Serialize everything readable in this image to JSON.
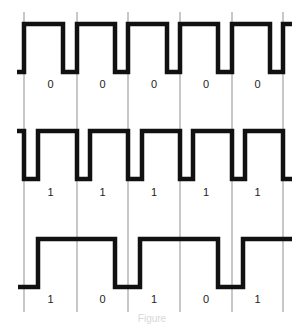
{
  "diagram": {
    "colors": {
      "background": "#ffffff",
      "waveform": "#111111",
      "gridline": "#c8c8c8",
      "label": "#222222"
    },
    "gridlines_x": [
      24,
      77,
      128,
      180,
      232,
      283
    ],
    "rows": [
      {
        "name": "all-zeros",
        "bits": [
          "0",
          "0",
          "0",
          "0",
          "0"
        ],
        "high_y": 24,
        "low_y": 72,
        "label_y": 88,
        "waveform_points": [
          [
            17,
            72
          ],
          [
            24,
            72
          ],
          [
            24,
            24
          ],
          [
            63,
            24
          ],
          [
            63,
            72
          ],
          [
            77,
            72
          ],
          [
            77,
            24
          ],
          [
            115,
            24
          ],
          [
            115,
            72
          ],
          [
            128,
            72
          ],
          [
            128,
            24
          ],
          [
            167,
            24
          ],
          [
            167,
            72
          ],
          [
            180,
            72
          ],
          [
            180,
            24
          ],
          [
            218,
            24
          ],
          [
            218,
            72
          ],
          [
            232,
            72
          ],
          [
            232,
            24
          ],
          [
            270,
            24
          ],
          [
            270,
            72
          ],
          [
            283,
            72
          ],
          [
            283,
            24
          ],
          [
            292,
            24
          ]
        ]
      },
      {
        "name": "all-ones",
        "bits": [
          "1",
          "1",
          "1",
          "1",
          "1"
        ],
        "high_y": 131,
        "low_y": 179,
        "label_y": 196,
        "waveform_points": [
          [
            17,
            131
          ],
          [
            24,
            131
          ],
          [
            24,
            179
          ],
          [
            38,
            179
          ],
          [
            38,
            131
          ],
          [
            77,
            131
          ],
          [
            77,
            179
          ],
          [
            90,
            179
          ],
          [
            90,
            131
          ],
          [
            128,
            131
          ],
          [
            128,
            179
          ],
          [
            142,
            179
          ],
          [
            142,
            131
          ],
          [
            180,
            131
          ],
          [
            180,
            179
          ],
          [
            193,
            179
          ],
          [
            193,
            131
          ],
          [
            232,
            131
          ],
          [
            232,
            179
          ],
          [
            245,
            179
          ],
          [
            245,
            131
          ],
          [
            283,
            131
          ],
          [
            283,
            179
          ],
          [
            292,
            179
          ]
        ]
      },
      {
        "name": "alternating",
        "bits": [
          "1",
          "0",
          "1",
          "0",
          "1"
        ],
        "high_y": 239,
        "low_y": 287,
        "label_y": 303,
        "waveform_points": [
          [
            18,
            287
          ],
          [
            38,
            287
          ],
          [
            38,
            239
          ],
          [
            115,
            239
          ],
          [
            115,
            287
          ],
          [
            140,
            287
          ],
          [
            140,
            239
          ],
          [
            218,
            239
          ],
          [
            218,
            287
          ],
          [
            243,
            287
          ],
          [
            243,
            239
          ],
          [
            292,
            239
          ]
        ]
      }
    ],
    "caption": "Figure"
  }
}
